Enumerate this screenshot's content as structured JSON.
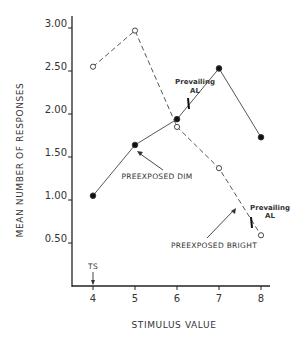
{
  "chart_data": {
    "type": "line",
    "title": "",
    "xlabel": "STIMULUS VALUE",
    "ylabel": "MEAN NUMBER OF RESPONSES",
    "x": [
      4,
      5,
      6,
      7,
      8
    ],
    "xlim": [
      3.5,
      8.2
    ],
    "ylim": [
      0,
      3.0
    ],
    "x_ticks": [
      "4",
      "5",
      "6",
      "7",
      "8"
    ],
    "y_ticks": [
      "0.50",
      "1.00",
      "1.50",
      "2.00",
      "2.50",
      "3.00"
    ],
    "y_tick_values": [
      0.5,
      1.0,
      1.5,
      2.0,
      2.5,
      3.0
    ],
    "grid": false,
    "legend": "none (series labeled by annotations)",
    "series": [
      {
        "name": "PREEXPOSED DIM",
        "style": "solid line, filled circles",
        "values": [
          1.05,
          1.64,
          1.94,
          2.53,
          1.73
        ]
      },
      {
        "name": "PREEXPOSED BRIGHT",
        "style": "dashed line, open circles",
        "values": [
          2.55,
          2.97,
          1.85,
          1.37,
          0.59
        ]
      }
    ],
    "annotations": [
      {
        "text": "TS",
        "x": 4,
        "note": "arrow pointing down to x=4 on axis"
      },
      {
        "text": "Prevailing AL",
        "series": "PREEXPOSED DIM",
        "x": 6.3,
        "note": "tick mark on dim line between 6 and 7"
      },
      {
        "text": "Prevailing AL",
        "series": "PREEXPOSED BRIGHT",
        "x": 7.8,
        "note": "tick mark on bright line between 7 and 8"
      },
      {
        "text": "PREEXPOSED DIM",
        "note": "arrow pointing to dim line near x=5"
      },
      {
        "text": "PREEXPOSED BRIGHT",
        "note": "arrow pointing to bright line near x=7.4"
      }
    ]
  },
  "labels": {
    "xlabel": "STIMULUS VALUE",
    "ylabel": "MEAN NUMBER OF RESPONSES",
    "ts": "TS",
    "prevailing_line1": "Prevailing",
    "prevailing_line2": "AL",
    "dim": "PREEXPOSED DIM",
    "bright": "PREEXPOSED BRIGHT"
  }
}
